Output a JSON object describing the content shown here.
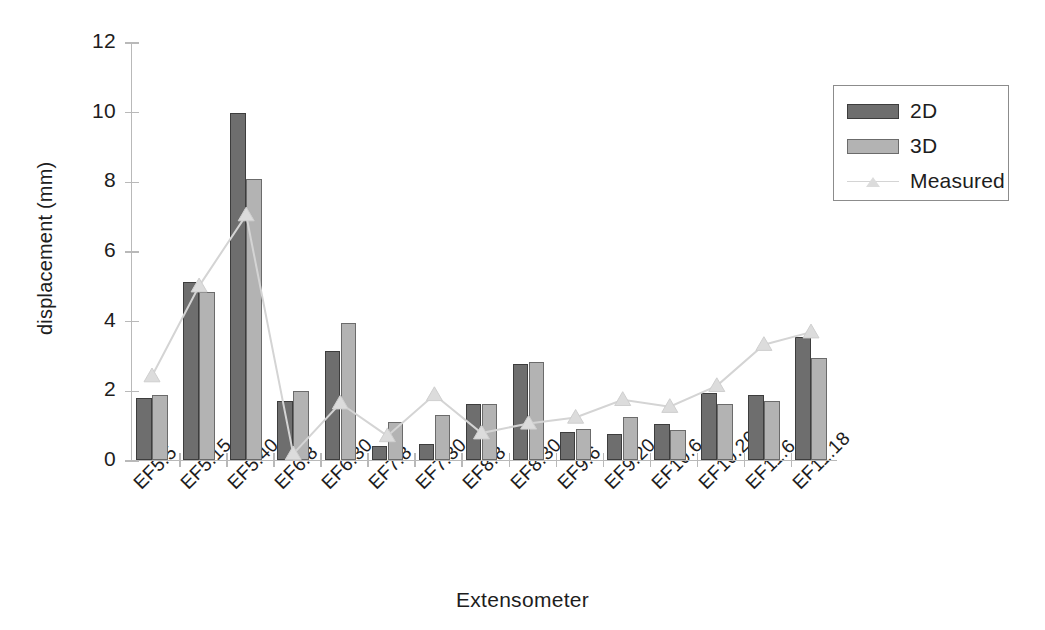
{
  "chart_data": {
    "type": "bar",
    "title": "",
    "xlabel": "Extensometer",
    "ylabel": "displacement (mm)",
    "ylim": [
      0,
      12
    ],
    "yticks": [
      0,
      2,
      4,
      6,
      8,
      10,
      12
    ],
    "grid": false,
    "legend_position": "upper right",
    "categories": [
      "EF5.5",
      "EF5.15",
      "EF5.40",
      "EF6.8",
      "EF6.30",
      "EF7.8",
      "EF7.30",
      "EF8.8",
      "EF8.30",
      "EF9.6",
      "EF9.20",
      "EF10.6",
      "EF10.20",
      "EF11.6",
      "EF11.18"
    ],
    "series": [
      {
        "name": "2D",
        "kind": "bar",
        "color": "#6e6e6e",
        "values": [
          1.78,
          5.1,
          9.95,
          1.69,
          3.13,
          0.4,
          0.46,
          1.62,
          2.76,
          0.8,
          0.76,
          1.02,
          1.93,
          1.88,
          3.53
        ]
      },
      {
        "name": "3D",
        "kind": "bar",
        "color": "#b3b3b3",
        "values": [
          1.88,
          4.82,
          8.06,
          1.97,
          3.93,
          1.08,
          1.3,
          1.6,
          2.81,
          0.89,
          1.23,
          0.87,
          1.62,
          1.7,
          2.94
        ]
      },
      {
        "name": "Measured",
        "kind": "line",
        "color": "#d4d4d4",
        "marker": "triangle",
        "values": [
          2.44,
          5.02,
          7.06,
          0.2,
          1.66,
          0.72,
          1.9,
          0.8,
          1.08,
          1.25,
          1.76,
          1.56,
          2.16,
          3.34,
          3.7
        ]
      }
    ]
  },
  "legend": {
    "items": [
      {
        "label": "2D",
        "type": "swatch-2d"
      },
      {
        "label": "3D",
        "type": "swatch-3d"
      },
      {
        "label": "Measured",
        "type": "line-marker"
      }
    ]
  }
}
